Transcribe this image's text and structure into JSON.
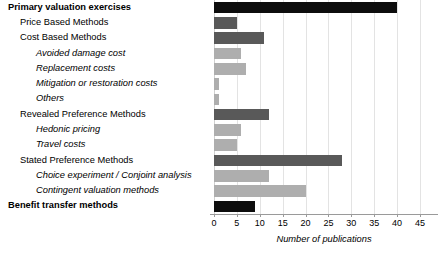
{
  "chart_data": {
    "type": "bar",
    "orientation": "horizontal",
    "title": "",
    "xlabel": "Number of publications",
    "ylabel": "",
    "xlim": [
      0,
      45
    ],
    "xticks": [
      0,
      5,
      10,
      15,
      20,
      25,
      30,
      35,
      40,
      45
    ],
    "grid": true,
    "legend": "none",
    "categories": [
      "Primary valuation exercises",
      "Price Based Methods",
      "Cost Based Methods",
      "Avoided damage cost",
      "Replacement costs",
      "Mitigation or restoration costs",
      "Others",
      "Revealed Preference Methods",
      "Hedonic pricing",
      "Travel costs",
      "Stated Preference Methods",
      "Choice experiment / Conjoint analysis",
      "Contingent valuation methods",
      "Benefit transfer methods"
    ],
    "values": [
      40,
      5,
      11,
      6,
      7,
      1,
      1,
      12,
      6,
      5,
      28,
      12,
      20,
      9
    ],
    "levels": [
      1,
      2,
      2,
      3,
      3,
      3,
      3,
      2,
      3,
      3,
      2,
      3,
      3,
      1
    ],
    "colors": {
      "level_1": "#0d0d0d",
      "level_2": "#595959",
      "level_3": "#aeaeae"
    },
    "bar_colors": [
      "#0d0d0d",
      "#595959",
      "#595959",
      "#aeaeae",
      "#aeaeae",
      "#aeaeae",
      "#aeaeae",
      "#595959",
      "#aeaeae",
      "#aeaeae",
      "#595959",
      "#aeaeae",
      "#aeaeae",
      "#0d0d0d"
    ],
    "gridline_color": "#e3e3e3",
    "axis_color": "#9a9a9a"
  }
}
